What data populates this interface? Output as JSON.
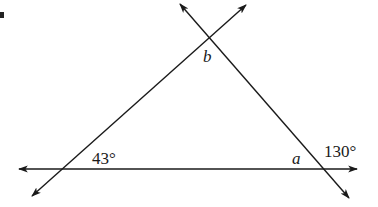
{
  "diagram": {
    "type": "geometry-triangle-with-extended-lines",
    "line_color": "#1a1a1a",
    "background": "#ffffff",
    "labels": {
      "vertex_top": "b",
      "vertex_right_interior": "a",
      "angle_left": "43°",
      "angle_right_exterior": "130°"
    },
    "lines": [
      {
        "name": "horizontal-line",
        "arrows": "both"
      },
      {
        "name": "left-slanted-line",
        "arrows": "both"
      },
      {
        "name": "right-slanted-line",
        "arrows": "both"
      }
    ]
  }
}
